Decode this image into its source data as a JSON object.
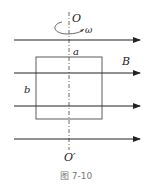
{
  "diagram": {
    "labels": {
      "axis_top": "O",
      "omega": "ω",
      "side_a": "a",
      "field": "B",
      "side_b": "b",
      "axis_bottom": "O′"
    },
    "caption": "图 7-10",
    "field_lines": [
      {
        "y": 40
      },
      {
        "y": 73
      },
      {
        "y": 106
      },
      {
        "y": 139
      }
    ],
    "field_direction": "right",
    "coil": {
      "x": 36,
      "y": 57,
      "width": 66,
      "height": 62
    },
    "axis": {
      "x": 69,
      "y_top": 12,
      "y_bottom": 150,
      "style": "dash-dot"
    },
    "colors": {
      "line": "#222222",
      "caption": "#777777"
    }
  }
}
